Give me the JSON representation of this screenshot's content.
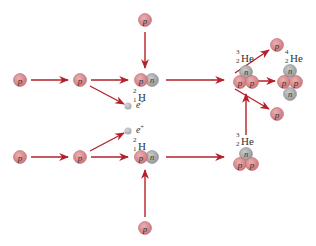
{
  "colors": {
    "proton_fill": "#d9868a",
    "proton_stroke": "#b86a6e",
    "neutron_fill": "#a7a9ab",
    "neutron_stroke": "#8d8f91",
    "positron_fill": "#b8babb",
    "arrow": "#b5202a",
    "text": "#333333"
  },
  "particles": {
    "proton_letter": "p",
    "neutron_letter": "n"
  },
  "labels": {
    "deuterium_top": {
      "mass": "2",
      "atomic": "1",
      "symbol": "H"
    },
    "deuterium_bottom": {
      "mass": "2",
      "atomic": "1",
      "symbol": "H"
    },
    "he3_top": {
      "mass": "3",
      "atomic": "2",
      "symbol": "He"
    },
    "he3_bottom": {
      "mass": "3",
      "atomic": "2",
      "symbol": "He"
    },
    "he4": {
      "mass": "4",
      "atomic": "2",
      "symbol": "He"
    },
    "positron_top": {
      "symbol": "e",
      "charge": "+"
    },
    "positron_bottom": {
      "symbol": "e",
      "charge": "+"
    }
  }
}
